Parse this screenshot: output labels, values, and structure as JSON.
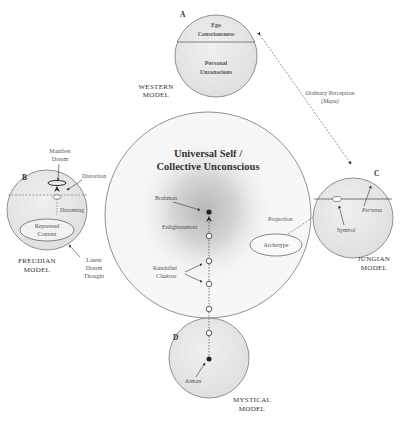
{
  "diagram": {
    "center": {
      "title_line1": "Universal Self /",
      "title_line2": "Collective Unconscious",
      "brahman": "Brahman",
      "enlightenment": "Enlightenment",
      "kundalini": "Kundalini",
      "chakras": "Chakras",
      "projection": "Projection",
      "archetype": "Archetype"
    },
    "western": {
      "letter": "A",
      "ego_line1": "Ego",
      "ego_line2": "Consciousness",
      "personal_line1": "Personal",
      "personal_line2": "Unconscious",
      "model_line1": "WESTERN",
      "model_line2": "MODEL"
    },
    "perception": {
      "line1": "Ordinary Perception",
      "line2": "(Maya)"
    },
    "freudian": {
      "letter": "B",
      "manifest_line1": "Manifest",
      "manifest_line2": "Dream",
      "distortion": "Distortion",
      "dreaming": "Dreaming",
      "repressed_line1": "Repressed",
      "repressed_line2": "Content",
      "latent_line1": "Latent",
      "latent_line2": "Dream",
      "latent_line3": "Thought",
      "model_line1": "FREUDIAN",
      "model_line2": "MODEL"
    },
    "jungian": {
      "letter": "C",
      "persona": "Persona",
      "symbol": "Symbol",
      "model_line1": "JUNGIAN",
      "model_line2": "MODEL"
    },
    "mystical": {
      "letter": "D",
      "atman": "Atman",
      "model_line1": "MYSTICAL",
      "model_line2": "MODEL"
    },
    "colors": {
      "circle_fill": "#e6e6e6",
      "center_glow": "#bdbdbd",
      "stroke": "#777777",
      "text": "#444444"
    }
  }
}
